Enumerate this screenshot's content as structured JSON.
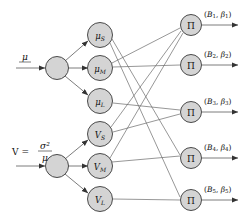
{
  "diagram": {
    "type": "network-graph",
    "colors": {
      "node_fill": "#d4d4d4",
      "node_stroke": "#4a4a4a",
      "edge": "#5a5a5a",
      "text": "#111111",
      "background": "#ffffff"
    },
    "inputs": [
      {
        "id": "input-mu",
        "label_main": "μ",
        "label_full": "μ",
        "underline": true,
        "cx": 57,
        "cy": 68
      },
      {
        "id": "input-v",
        "label_main": "V",
        "equals": "=",
        "numerator": "σ²",
        "denominator": "μ",
        "label_full": "V = σ²/μ",
        "cx": 57,
        "cy": 166
      }
    ],
    "hidden": [
      {
        "id": "node-mu-s",
        "base": "μ",
        "sub": "S",
        "label": "μS",
        "cx": 100,
        "cy": 35
      },
      {
        "id": "node-mu-m",
        "base": "μ",
        "sub": "M",
        "label": "μM",
        "cx": 100,
        "cy": 68
      },
      {
        "id": "node-mu-l",
        "base": "μ",
        "sub": "L",
        "label": "μL",
        "cx": 100,
        "cy": 101
      },
      {
        "id": "node-v-s",
        "base": "V",
        "sub": "S",
        "label": "VS",
        "cx": 100,
        "cy": 134
      },
      {
        "id": "node-v-m",
        "base": "V",
        "sub": "M",
        "label": "VM",
        "cx": 100,
        "cy": 166
      },
      {
        "id": "node-v-l",
        "base": "V",
        "sub": "L",
        "label": "VL",
        "cx": 100,
        "cy": 199
      }
    ],
    "outputs": [
      {
        "id": "node-pi-1",
        "symbol": "Π",
        "cx": 191,
        "cy": 25,
        "out_base": "B",
        "out_sub": "1",
        "out_beta": "β",
        "out_label": "(B1, β1)"
      },
      {
        "id": "node-pi-2",
        "symbol": "Π",
        "cx": 191,
        "cy": 65,
        "out_base": "B",
        "out_sub": "2",
        "out_beta": "β",
        "out_label": "(B2, β2)"
      },
      {
        "id": "node-pi-3",
        "symbol": "Π",
        "cx": 191,
        "cy": 112,
        "out_base": "B",
        "out_sub": "3",
        "out_beta": "β",
        "out_label": "(B3, β3)"
      },
      {
        "id": "node-pi-4",
        "symbol": "Π",
        "cx": 191,
        "cy": 158,
        "out_base": "B",
        "out_sub": "4",
        "out_beta": "β",
        "out_label": "(B4, β4)"
      },
      {
        "id": "node-pi-5",
        "symbol": "Π",
        "cx": 191,
        "cy": 200,
        "out_base": "B",
        "out_sub": "5",
        "out_beta": "β",
        "out_label": "(B5, β5)"
      }
    ],
    "edges": [
      {
        "from": "input-mu",
        "to": "node-mu-s"
      },
      {
        "from": "input-mu",
        "to": "node-mu-m"
      },
      {
        "from": "input-mu",
        "to": "node-mu-l"
      },
      {
        "from": "input-v",
        "to": "node-v-s"
      },
      {
        "from": "input-v",
        "to": "node-v-m"
      },
      {
        "from": "input-v",
        "to": "node-v-l"
      },
      {
        "from": "node-mu-s",
        "to": "node-pi-4"
      },
      {
        "from": "node-mu-s",
        "to": "node-pi-5"
      },
      {
        "from": "node-mu-m",
        "to": "node-pi-1"
      },
      {
        "from": "node-mu-m",
        "to": "node-pi-2"
      },
      {
        "from": "node-mu-l",
        "to": "node-pi-3"
      },
      {
        "from": "node-v-s",
        "to": "node-pi-1"
      },
      {
        "from": "node-v-s",
        "to": "node-pi-3"
      },
      {
        "from": "node-v-m",
        "to": "node-pi-1"
      },
      {
        "from": "node-v-m",
        "to": "node-pi-4"
      },
      {
        "from": "node-v-l",
        "to": "node-pi-5"
      }
    ]
  }
}
